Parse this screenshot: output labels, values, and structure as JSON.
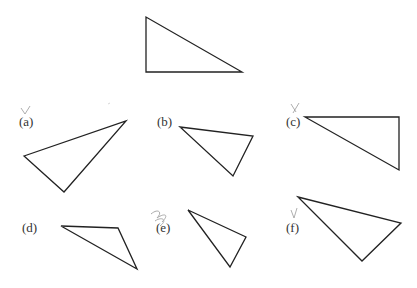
{
  "figure": {
    "reference_triangle": {
      "points": "146,17 146,72 242,72"
    },
    "options": [
      {
        "label": "(a)",
        "points": "24,156 126,121 64,192",
        "label_x": 19,
        "label_y": 114,
        "mark": "check"
      },
      {
        "label": "(b)",
        "points": "180,127 253,136 233,176",
        "label_x": 157,
        "label_y": 114,
        "mark": ""
      },
      {
        "label": "(c)",
        "points": "305,117 399,117 399,170",
        "label_x": 286,
        "label_y": 114,
        "mark": "check"
      },
      {
        "label": "(d)",
        "points": "61,226 118,228 137,269",
        "label_x": 22,
        "label_y": 220,
        "mark": ""
      },
      {
        "label": "(e)",
        "points": "188,210 246,237 230,267",
        "label_x": 156,
        "label_y": 220,
        "mark": "scribble"
      },
      {
        "label": "(f)",
        "points": "298,197 401,223 362,261",
        "label_x": 286,
        "label_y": 220,
        "mark": "check"
      }
    ]
  },
  "colors": {
    "stroke": "#222222",
    "pencil": "#888888"
  }
}
